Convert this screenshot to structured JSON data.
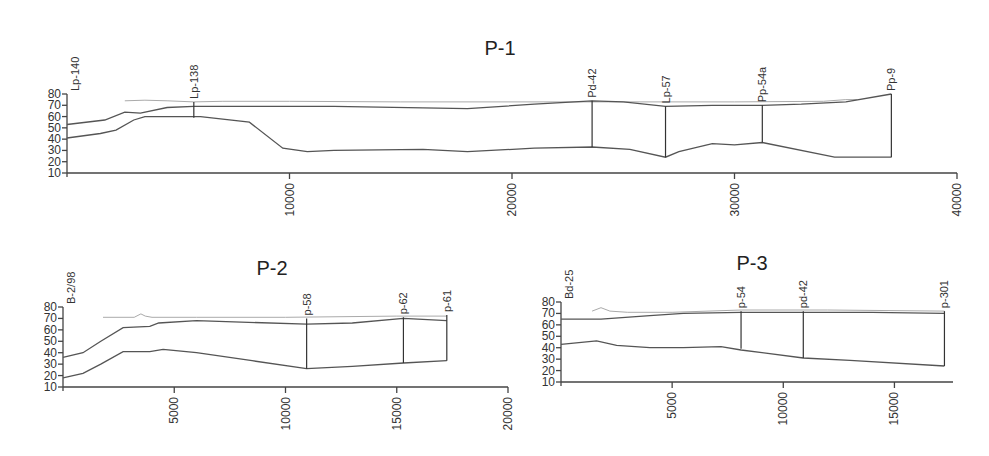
{
  "chart_data": [
    {
      "id": "p1",
      "type": "line",
      "title": "P-1",
      "xlabel": "",
      "ylabel": "",
      "xlim": [
        0,
        40000
      ],
      "ylim": [
        10,
        80
      ],
      "x_ticks": [
        10000,
        20000,
        30000,
        40000
      ],
      "x_tick_labels": [
        "10000",
        "20000",
        "30000",
        "40000"
      ],
      "y_ticks": [
        10,
        20,
        30,
        40,
        50,
        60,
        70,
        80
      ],
      "y_tick_labels": [
        "10",
        "20",
        "30",
        "40",
        "50",
        "60",
        "70",
        "80"
      ],
      "grid": false,
      "legend": null,
      "boreholes": [
        {
          "label": "Lp-140",
          "x": 0,
          "top": 80,
          "bottom": 80
        },
        {
          "label": "Lp-138",
          "x": 5700,
          "top": 73,
          "bottom": 59
        },
        {
          "label": "Pd-42",
          "x": 23600,
          "top": 74,
          "bottom": 33
        },
        {
          "label": "Lp-57",
          "x": 26900,
          "top": 69,
          "bottom": 24
        },
        {
          "label": "Pp-54a",
          "x": 31250,
          "top": 70,
          "bottom": 37
        },
        {
          "label": "Pp-9",
          "x": 37050,
          "top": 80,
          "bottom": 24
        }
      ],
      "series": [
        {
          "name": "water-table",
          "style": "light",
          "x": [
            2600,
            3500,
            4500,
            5700,
            7000,
            10000,
            15000,
            20000,
            25000,
            30000,
            34000,
            35000,
            35500
          ],
          "y": [
            74,
            74.5,
            74,
            73,
            73.5,
            73.5,
            73,
            73,
            73,
            73,
            73.5,
            75,
            75
          ]
        },
        {
          "name": "ground-surface",
          "style": "dark",
          "x": [
            0,
            1700,
            2600,
            3300,
            4500,
            5700,
            8000,
            12000,
            18000,
            21000,
            23600,
            25000,
            26900,
            29000,
            31250,
            33000,
            35000,
            37050
          ],
          "y": [
            53,
            57,
            64,
            63,
            68,
            69,
            69,
            69,
            67,
            71,
            74,
            73,
            69,
            70,
            70,
            71,
            73,
            80
          ]
        },
        {
          "name": "bedrock",
          "style": "dark",
          "x": [
            0,
            1500,
            2200,
            3000,
            3500,
            4500,
            6000,
            8200,
            9700,
            10800,
            12000,
            16000,
            18000,
            21000,
            23600,
            25300,
            26900,
            27500,
            29000,
            30000,
            31250,
            34500,
            37050
          ],
          "y": [
            41,
            45,
            48,
            57,
            60,
            60,
            60,
            55,
            32,
            29,
            30,
            31,
            29,
            32,
            33,
            31,
            24,
            29,
            36,
            35,
            37,
            24,
            24
          ]
        }
      ]
    },
    {
      "id": "p2",
      "type": "line",
      "title": "P-2",
      "xlabel": "",
      "ylabel": "",
      "xlim": [
        0,
        20000
      ],
      "ylim": [
        10,
        80
      ],
      "x_ticks": [
        5000,
        10000,
        15000,
        20000
      ],
      "x_tick_labels": [
        "5000",
        "10000",
        "15000",
        "20000"
      ],
      "y_ticks": [
        10,
        20,
        30,
        40,
        50,
        60,
        70,
        80
      ],
      "y_tick_labels": [
        "10",
        "20",
        "30",
        "40",
        "50",
        "60",
        "70",
        "80"
      ],
      "grid": false,
      "legend": null,
      "boreholes": [
        {
          "label": "B-2/98",
          "x": 0,
          "top": 80,
          "bottom": 80
        },
        {
          "label": "p-58",
          "x": 10950,
          "top": 70,
          "bottom": 26
        },
        {
          "label": "p-62",
          "x": 15300,
          "top": 71,
          "bottom": 31
        },
        {
          "label": "p-61",
          "x": 17250,
          "top": 73,
          "bottom": 33
        }
      ],
      "series": [
        {
          "name": "water-table",
          "style": "light",
          "x": [
            1800,
            3200,
            3500,
            3700,
            4000,
            6000,
            10000,
            15000,
            17250
          ],
          "y": [
            71,
            71,
            74,
            72,
            71,
            71,
            71,
            72,
            72
          ]
        },
        {
          "name": "ground-surface",
          "style": "dark",
          "x": [
            0,
            900,
            1700,
            2700,
            3900,
            4300,
            6000,
            10950,
            13000,
            15300,
            17250
          ],
          "y": [
            36,
            40,
            50,
            62,
            63,
            66,
            68,
            65,
            66,
            70,
            68
          ]
        },
        {
          "name": "bedrock",
          "style": "dark",
          "x": [
            0,
            900,
            1700,
            2700,
            3900,
            4500,
            6000,
            8500,
            10950,
            13000,
            15300,
            17250
          ],
          "y": [
            18,
            22,
            30,
            41,
            41,
            43,
            40,
            33,
            26,
            28,
            31,
            33
          ]
        }
      ]
    },
    {
      "id": "p3",
      "type": "line",
      "title": "P-3",
      "xlabel": "",
      "ylabel": "",
      "xlim": [
        0,
        17500
      ],
      "ylim": [
        10,
        80
      ],
      "x_ticks": [
        5000,
        10000,
        15000
      ],
      "x_tick_labels": [
        "5000",
        "10000",
        "15000"
      ],
      "y_ticks": [
        10,
        20,
        30,
        40,
        50,
        60,
        70,
        80
      ],
      "y_tick_labels": [
        "10",
        "20",
        "30",
        "40",
        "50",
        "60",
        "70",
        "80"
      ],
      "grid": false,
      "legend": null,
      "boreholes": [
        {
          "label": "Bd-25",
          "x": 0,
          "top": 80,
          "bottom": 80
        },
        {
          "label": "p-54",
          "x": 8100,
          "top": 72,
          "bottom": 39
        },
        {
          "label": "pd-42",
          "x": 10900,
          "top": 72,
          "bottom": 31
        },
        {
          "label": "p-301",
          "x": 17250,
          "top": 72,
          "bottom": 24
        }
      ],
      "series": [
        {
          "name": "water-table",
          "style": "light",
          "x": [
            1400,
            1800,
            2200,
            3000,
            5000,
            8100,
            12000,
            17250
          ],
          "y": [
            72,
            75,
            72,
            71,
            71,
            73,
            73,
            72
          ]
        },
        {
          "name": "ground-surface",
          "style": "dark",
          "x": [
            0,
            1800,
            4000,
            5500,
            8100,
            10900,
            14000,
            17250
          ],
          "y": [
            65,
            65,
            68,
            70,
            71,
            71,
            71,
            70
          ]
        },
        {
          "name": "bedrock",
          "style": "dark",
          "x": [
            0,
            1600,
            2500,
            4000,
            5500,
            7200,
            8100,
            10900,
            13000,
            17250
          ],
          "y": [
            43,
            46,
            42,
            40,
            40,
            41,
            38,
            31,
            29,
            24
          ]
        }
      ]
    }
  ],
  "layout": {
    "p1": {
      "x0": 67,
      "xscale_px": 890,
      "y_top": 94,
      "y_bot": 173,
      "title_x": 500,
      "title_y": 55,
      "axis_end": 957
    },
    "p2": {
      "x0": 63,
      "xscale_px": 445,
      "y_top": 307,
      "y_bot": 387,
      "title_x": 272,
      "title_y": 275,
      "axis_end": 508
    },
    "p3": {
      "x0": 561,
      "xscale_px": 389,
      "y_top": 302,
      "y_bot": 382,
      "title_x": 752,
      "title_y": 270,
      "axis_end": 953
    }
  }
}
